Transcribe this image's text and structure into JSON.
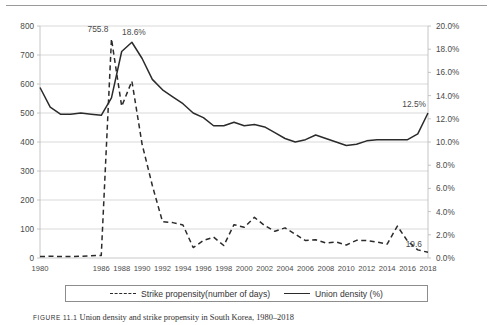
{
  "figure": {
    "caption_label": "FIGURE 11.1",
    "caption_text": "Union density and strike propensity in South Korea, 1980–2018"
  },
  "legend": {
    "items": [
      {
        "label": "Strike propensity(number of days)",
        "style": "dashed"
      },
      {
        "label": "Union density (%)",
        "style": "solid"
      }
    ]
  },
  "chart_data": {
    "type": "line",
    "title": "",
    "xlabel": "",
    "ylabel": "",
    "y2label": "",
    "grid": true,
    "legend_position": "bottom",
    "ylim": [
      0,
      800
    ],
    "y2lim": [
      0,
      0.2
    ],
    "y_ticks": [
      "0",
      "100",
      "200",
      "300",
      "400",
      "500",
      "600",
      "700",
      "800"
    ],
    "y2_ticks": [
      "0.0%",
      "2.0%",
      "4.0%",
      "6.0%",
      "8.0%",
      "10.0%",
      "12.0%",
      "14.0%",
      "16.0%",
      "18.0%",
      "20.0%"
    ],
    "x_tick_labels": [
      "1980",
      "1986",
      "1988",
      "1990",
      "1992",
      "1994",
      "1996",
      "1998",
      "2000",
      "2002",
      "2004",
      "2006",
      "2008",
      "2010",
      "2012",
      "2014",
      "2016",
      "2018"
    ],
    "x": [
      1980,
      1981,
      1982,
      1983,
      1984,
      1985,
      1986,
      1987,
      1988,
      1989,
      1990,
      1991,
      1992,
      1993,
      1994,
      1995,
      1996,
      1997,
      1998,
      1999,
      2000,
      2001,
      2002,
      2003,
      2004,
      2005,
      2006,
      2007,
      2008,
      2009,
      2010,
      2011,
      2012,
      2013,
      2014,
      2015,
      2016,
      2017,
      2018
    ],
    "annotations": [
      {
        "text": "755.8",
        "series": "Strike propensity(number of days)",
        "x": 1987,
        "value": 755.8
      },
      {
        "text": "18.6%",
        "series": "Union density (%)",
        "x": 1989,
        "value": 18.6
      },
      {
        "text": "12.5%",
        "series": "Union density (%)",
        "x": 2018,
        "value": 12.5
      },
      {
        "text": "19.6",
        "series": "Strike propensity(number of days)",
        "x": 2018,
        "value": 19.6
      }
    ],
    "series": [
      {
        "name": "Strike propensity(number of days)",
        "axis": "left",
        "style": "dashed",
        "color": "#2b2b2b",
        "values": [
          5,
          6,
          5,
          5,
          6,
          8,
          9,
          755.8,
          523,
          610,
          392,
          250,
          125,
          122,
          114,
          36,
          60,
          72,
          43,
          115,
          106,
          140,
          112,
          92,
          104,
          82,
          60,
          63,
          52,
          55,
          45,
          61,
          60,
          55,
          48,
          110,
          58,
          28,
          19.6
        ]
      },
      {
        "name": "Union density (%)",
        "axis": "right",
        "style": "solid",
        "color": "#2b2b2b",
        "values": [
          14.7,
          13.0,
          12.4,
          12.4,
          12.5,
          12.4,
          12.3,
          13.8,
          17.8,
          18.6,
          17.2,
          15.4,
          14.5,
          13.9,
          13.3,
          12.5,
          12.1,
          11.4,
          11.4,
          11.7,
          11.4,
          11.5,
          11.3,
          10.8,
          10.3,
          10.0,
          10.2,
          10.6,
          10.3,
          10.0,
          9.7,
          9.8,
          10.1,
          10.2,
          10.2,
          10.2,
          10.2,
          10.7,
          12.5
        ]
      }
    ]
  }
}
